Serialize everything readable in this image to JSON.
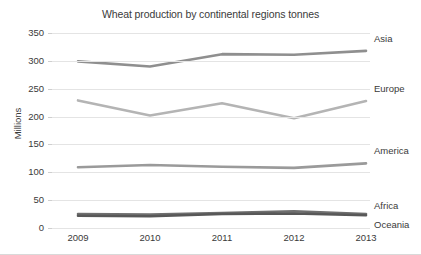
{
  "chart_data": {
    "type": "line",
    "title": "Wheat production by continental regions tonnes",
    "xlabel": "",
    "ylabel": "Millions",
    "categories": [
      "2009",
      "2010",
      "2011",
      "2012",
      "2013"
    ],
    "x": [
      2009,
      2010,
      2011,
      2012,
      2013
    ],
    "ylim": [
      0,
      350
    ],
    "ytick_step": 50,
    "yticks": [
      "350",
      "300",
      "250",
      "200",
      "150",
      "100",
      "50",
      "0"
    ],
    "grid": true,
    "legend_position": "right-inline-labels",
    "series": [
      {
        "name": "Asia",
        "values": [
          299,
          290,
          312,
          311,
          318
        ],
        "color": "#8f8f8f"
      },
      {
        "name": "Europe",
        "values": [
          229,
          202,
          224,
          197,
          228
        ],
        "color": "#b4b4b4"
      },
      {
        "name": "America",
        "values": [
          109,
          113,
          110,
          108,
          116
        ],
        "color": "#9a9a9a"
      },
      {
        "name": "Africa",
        "values": [
          25,
          24,
          27,
          30,
          25
        ],
        "color": "#6f6f6f"
      },
      {
        "name": "Oceania",
        "values": [
          22,
          21,
          25,
          26,
          23
        ],
        "color": "#585858"
      }
    ]
  },
  "colors": {
    "background": "#ffffff",
    "text": "#3a3a3a",
    "gridline": "#e4e4e4",
    "frame_bottom": "#d9d9d9"
  }
}
